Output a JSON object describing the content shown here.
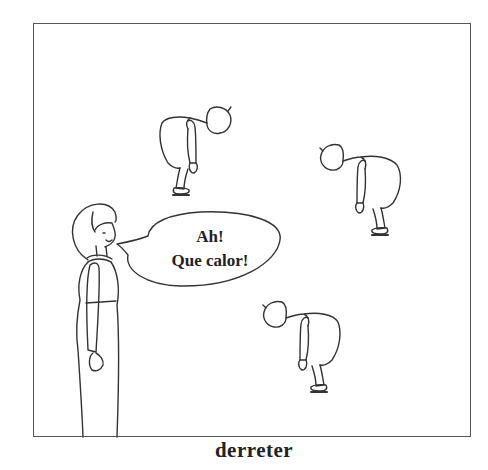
{
  "illustration": {
    "speech_bubble": {
      "line1": "Ah!",
      "line2": "Que calor!"
    },
    "figures": [
      {
        "name": "standing-woman",
        "pose": "standing, smiling, speaking"
      },
      {
        "name": "wilting-woman-top",
        "pose": "bent over, drooping"
      },
      {
        "name": "wilting-woman-right",
        "pose": "bent over, drooping"
      },
      {
        "name": "wilting-woman-bottom",
        "pose": "bent over, drooping"
      }
    ]
  },
  "caption": "derreter",
  "colors": {
    "line": "#333333",
    "frame": "#555555",
    "background": "#ffffff"
  }
}
